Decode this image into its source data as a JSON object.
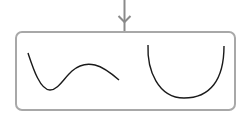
{
  "diagram": {
    "arrow": {
      "direction": "down",
      "color": "#8a8a8a"
    },
    "box": {
      "border_color": "#a0a0a0",
      "corner": "rounded"
    },
    "curves": [
      {
        "name": "wavy-curve",
        "description": "curve dipping to a minimum then rising to a local maximum and descending"
      },
      {
        "name": "u-shaped-curve",
        "description": "convex U-shaped curve"
      }
    ],
    "curve_color": "#1a1a1a"
  }
}
